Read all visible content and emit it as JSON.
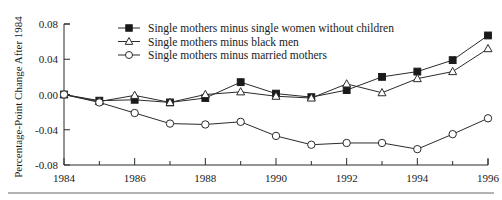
{
  "chart_data": {
    "type": "line",
    "title": "",
    "subtitle": "",
    "xlabel": "",
    "ylabel": "Percentage-Point Change After 1984",
    "x": [
      1984,
      1985,
      1986,
      1987,
      1988,
      1989,
      1990,
      1991,
      1992,
      1993,
      1994,
      1995,
      1996
    ],
    "xlim": [
      1984,
      1996
    ],
    "ylim": [
      -0.08,
      0.08
    ],
    "xticks": [
      1984,
      1986,
      1988,
      1990,
      1992,
      1994,
      1996
    ],
    "xtick_labels": [
      "1984",
      "1986",
      "1988",
      "1990",
      "1992",
      "1994",
      "1996"
    ],
    "x_minor_ticks": [
      1985,
      1987,
      1989,
      1991,
      1993,
      1995
    ],
    "yticks": [
      0.08,
      0.04,
      0.0,
      -0.04,
      -0.08
    ],
    "ytick_labels": [
      "0.08",
      "0.04",
      "0.00",
      "-0.04",
      "-0.08"
    ],
    "grid": false,
    "legend_position": "top-center",
    "series": [
      {
        "name": "Single mothers minus single women without children",
        "marker": "filled-square",
        "values": [
          0.0,
          -0.007,
          -0.006,
          -0.009,
          -0.004,
          0.014,
          0.001,
          -0.003,
          0.005,
          0.02,
          0.026,
          0.039,
          0.067
        ]
      },
      {
        "name": "Single mothers minus black men",
        "marker": "open-triangle",
        "values": [
          0.0,
          -0.008,
          -0.001,
          -0.009,
          0.0,
          0.003,
          -0.002,
          -0.004,
          0.012,
          0.002,
          0.018,
          0.026,
          0.052
        ]
      },
      {
        "name": "Single mothers minus married mothers",
        "marker": "open-circle",
        "values": [
          0.0,
          -0.009,
          -0.021,
          -0.033,
          -0.034,
          -0.031,
          -0.047,
          -0.057,
          -0.055,
          -0.055,
          -0.062,
          -0.045,
          -0.027
        ]
      }
    ]
  },
  "colors": {
    "axis": "#2b2b2b",
    "text": "#1a1a1a",
    "series_stroke": "#2b2b2b",
    "marker_fill": "#1a1a1a",
    "marker_open_fill": "#ffffff",
    "background": "#ffffff",
    "footer_rule": "#666666"
  }
}
